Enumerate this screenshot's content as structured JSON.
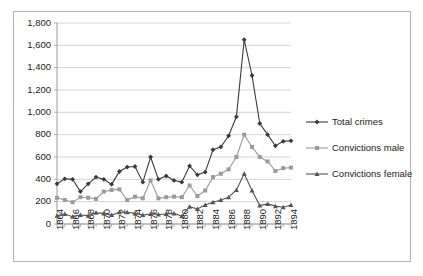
{
  "chart_data": {
    "type": "line",
    "title": "",
    "xlabel": "",
    "ylabel": "",
    "x": [
      1864,
      1865,
      1866,
      1867,
      1868,
      1869,
      1870,
      1871,
      1872,
      1873,
      1874,
      1875,
      1876,
      1877,
      1878,
      1879,
      1880,
      1881,
      1882,
      1883,
      1884,
      1885,
      1886,
      1887,
      1888,
      1889,
      1890,
      1891,
      1892,
      1893,
      1894
    ],
    "xlim": [
      1864,
      1894
    ],
    "ylim": [
      0,
      1800
    ],
    "ytick_values": [
      0,
      200,
      400,
      600,
      800,
      1000,
      1200,
      1400,
      1600,
      1800
    ],
    "ytick_labels": [
      "0",
      "200",
      "400",
      "600",
      "800",
      "1,000",
      "1,200",
      "1,400",
      "1,600",
      "1,800"
    ],
    "xtick_labels": [
      "1864",
      "1865",
      "1866",
      "1867",
      "1868",
      "1869",
      "1870",
      "1871",
      "1872",
      "1873",
      "1874",
      "1875",
      "1876",
      "1877",
      "1878",
      "1879",
      "1880",
      "1881",
      "1882",
      "1883",
      "1884",
      "1885",
      "1886",
      "1887",
      "1888",
      "1889",
      "1890",
      "1891",
      "1892",
      "1893",
      "1894"
    ],
    "xtick_labels_shown": [
      "1864",
      "1866",
      "1868",
      "1870",
      "1872",
      "1874",
      "1876",
      "1878",
      "1880",
      "1882",
      "1884",
      "1886",
      "1888",
      "1890",
      "1892",
      "1894"
    ],
    "grid": true,
    "legend_position": "right",
    "series": [
      {
        "name": "Total crimes",
        "color": "#3a3a3a",
        "marker": "diamond",
        "values": [
          360,
          405,
          400,
          290,
          360,
          420,
          400,
          355,
          470,
          510,
          515,
          375,
          600,
          400,
          430,
          390,
          375,
          520,
          440,
          465,
          665,
          690,
          790,
          960,
          1650,
          1330,
          900,
          800,
          700,
          740,
          745
        ]
      },
      {
        "name": "Convictions male",
        "color": "#9a9a9a",
        "marker": "square",
        "values": [
          235,
          215,
          195,
          240,
          235,
          225,
          290,
          305,
          310,
          215,
          245,
          230,
          390,
          230,
          240,
          245,
          240,
          345,
          250,
          300,
          420,
          450,
          490,
          600,
          800,
          690,
          600,
          560,
          475,
          500,
          505
        ]
      },
      {
        "name": "Convictions female",
        "color": "#555555",
        "marker": "triangle",
        "values": [
          75,
          90,
          65,
          80,
          75,
          100,
          95,
          80,
          105,
          105,
          95,
          80,
          90,
          85,
          90,
          95,
          70,
          155,
          135,
          170,
          195,
          215,
          240,
          305,
          450,
          300,
          165,
          180,
          160,
          150,
          170
        ]
      }
    ]
  },
  "legend": {
    "items": [
      {
        "label": "Total crimes"
      },
      {
        "label": "Convictions male"
      },
      {
        "label": "Convictions female"
      }
    ]
  }
}
